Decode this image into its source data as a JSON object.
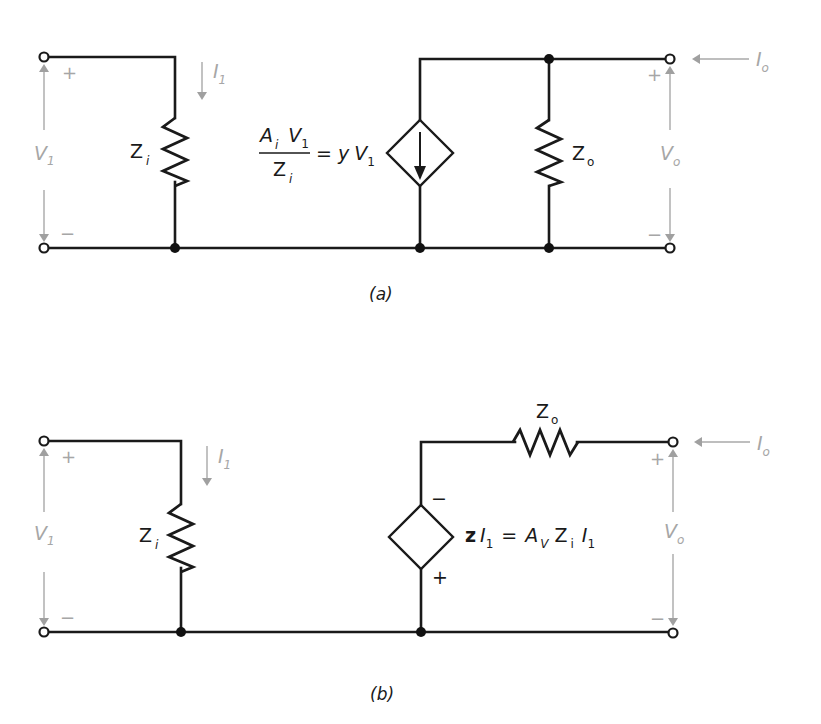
{
  "figure": {
    "panels": [
      {
        "id": "a",
        "caption": "(a)",
        "input": {
          "voltage_main": "V",
          "voltage_sub": "1",
          "plus": "+",
          "minus": "−",
          "current_main": "I",
          "current_sub": "1"
        },
        "input_impedance": {
          "main": "Z",
          "sub": "i"
        },
        "source": {
          "type": "dependent-current-source",
          "num_a": "A",
          "num_a_sub": "i",
          "num_v": "V",
          "num_v_sub": "1",
          "den_z": "Z",
          "den_z_sub": "i",
          "equals": "=",
          "rhs_y": "y",
          "rhs_v": "V",
          "rhs_v_sub": "1"
        },
        "output_impedance": {
          "main": "Z",
          "sub": "o"
        },
        "output": {
          "voltage_main": "V",
          "voltage_sub": "o",
          "plus": "+",
          "minus": "−",
          "current_main": "I",
          "current_sub": "o"
        }
      },
      {
        "id": "b",
        "caption": "(b)",
        "input": {
          "voltage_main": "V",
          "voltage_sub": "1",
          "plus": "+",
          "minus": "−",
          "current_main": "I",
          "current_sub": "1"
        },
        "input_impedance": {
          "main": "Z",
          "sub": "i"
        },
        "source": {
          "type": "dependent-voltage-source",
          "top_polarity": "−",
          "bottom_polarity": "+",
          "z": "z",
          "i": "I",
          "i_sub": "1",
          "equals": "=",
          "av": "A",
          "av_sub": "V",
          "zi": "Z",
          "zi_sub": "i",
          "i2": "I",
          "i2_sub": "1"
        },
        "output_impedance": {
          "main": "Z",
          "sub": "o"
        },
        "output": {
          "voltage_main": "V",
          "voltage_sub": "o",
          "plus": "+",
          "minus": "−",
          "current_main": "I",
          "current_sub": "o"
        }
      }
    ]
  }
}
